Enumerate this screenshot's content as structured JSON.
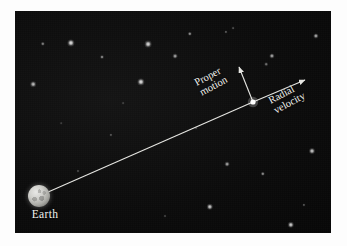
{
  "figure": {
    "kind": "astronomy-diagram",
    "background_color": "#0b0b0b",
    "line_color": "#e6e6e2",
    "label_color": "#f2f2ee"
  },
  "labels": {
    "earth": "Earth",
    "proper_motion_line1": "Proper",
    "proper_motion_line2": "motion",
    "radial_velocity_line1": "Radial",
    "radial_velocity_line2": "velocity"
  },
  "geometry": {
    "earth_point": {
      "x": 39,
      "y": 196
    },
    "star_point": {
      "x": 253,
      "y": 102
    },
    "proper_motion_tip": {
      "x": 239,
      "y": 66
    },
    "radial_velocity_tip": {
      "x": 306,
      "y": 79
    },
    "sight_line_angle_deg": -28,
    "label_rotation_deg": -28
  },
  "stars": [
    {
      "x": 56,
      "y": 32,
      "r": 3.6,
      "b": 0.95
    },
    {
      "x": 28,
      "y": 33,
      "r": 2.2,
      "b": 0.55
    },
    {
      "x": 87,
      "y": 46,
      "r": 2.0,
      "b": 0.6
    },
    {
      "x": 133,
      "y": 33,
      "r": 3.4,
      "b": 0.92
    },
    {
      "x": 160,
      "y": 45,
      "r": 2.4,
      "b": 0.7
    },
    {
      "x": 18,
      "y": 73,
      "r": 2.8,
      "b": 0.8
    },
    {
      "x": 126,
      "y": 71,
      "r": 3.6,
      "b": 0.95
    },
    {
      "x": 175,
      "y": 23,
      "r": 2.2,
      "b": 0.62
    },
    {
      "x": 211,
      "y": 21,
      "r": 1.6,
      "b": 0.42
    },
    {
      "x": 218,
      "y": 17,
      "r": 1.4,
      "b": 0.35
    },
    {
      "x": 257,
      "y": 45,
      "r": 2.6,
      "b": 0.72
    },
    {
      "x": 251,
      "y": 53,
      "r": 1.8,
      "b": 0.48
    },
    {
      "x": 301,
      "y": 25,
      "r": 2.6,
      "b": 0.74
    },
    {
      "x": 323,
      "y": 31,
      "r": 2.0,
      "b": 0.55
    },
    {
      "x": 212,
      "y": 153,
      "r": 2.4,
      "b": 0.7
    },
    {
      "x": 248,
      "y": 163,
      "r": 2.2,
      "b": 0.62
    },
    {
      "x": 297,
      "y": 140,
      "r": 3.0,
      "b": 0.85
    },
    {
      "x": 195,
      "y": 196,
      "r": 3.2,
      "b": 0.88
    },
    {
      "x": 276,
      "y": 214,
      "r": 3.2,
      "b": 0.88
    },
    {
      "x": 289,
      "y": 194,
      "r": 1.6,
      "b": 0.4
    },
    {
      "x": 96,
      "y": 124,
      "r": 1.6,
      "b": 0.38
    },
    {
      "x": 63,
      "y": 160,
      "r": 1.5,
      "b": 0.32
    },
    {
      "x": 150,
      "y": 205,
      "r": 1.5,
      "b": 0.3
    },
    {
      "x": 181,
      "y": 117,
      "r": 1.4,
      "b": 0.28
    },
    {
      "x": 108,
      "y": 92,
      "r": 1.4,
      "b": 0.26
    },
    {
      "x": 46,
      "y": 112,
      "r": 1.3,
      "b": 0.24
    },
    {
      "x": 230,
      "y": 225,
      "r": 1.4,
      "b": 0.26
    },
    {
      "x": 318,
      "y": 173,
      "r": 1.4,
      "b": 0.26
    }
  ]
}
